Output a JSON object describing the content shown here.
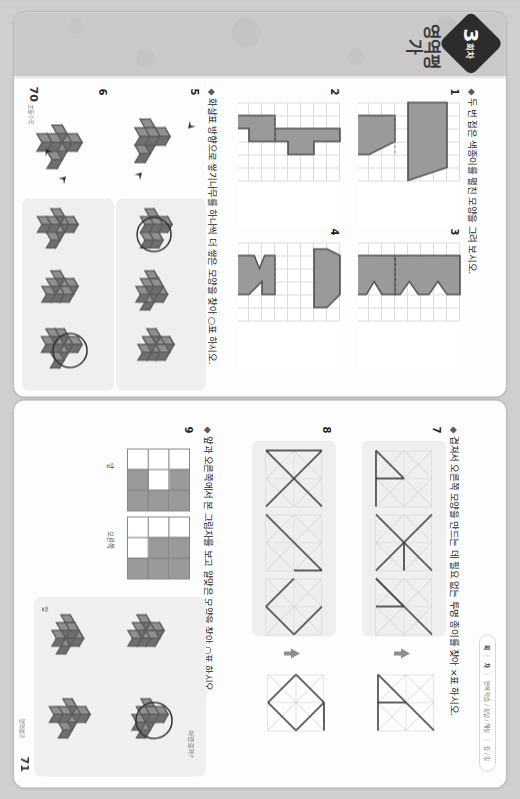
{
  "document": {
    "kind": "workbook-spread-scan",
    "rotation_note": "page is displayed rotated 90 degrees"
  },
  "left_page": {
    "badge": {
      "number": "3",
      "unit": "회차"
    },
    "section_title": "영역평가",
    "prompts": [
      {
        "bullet": "◆",
        "text": "두 번 접은 색종이를 펼친 모양을 그려 보시오."
      },
      {
        "bullet": "◆",
        "text": "화살표 방향으로 쌓기나무를 하나씩 더 쌓은 모양을 찾아 ○표 하시오."
      }
    ],
    "question_numbers": [
      "1",
      "2",
      "3",
      "4",
      "5",
      "6"
    ],
    "page_number": "70",
    "page_label": "초등수학"
  },
  "right_page": {
    "tab": {
      "items": [
        "회",
        "차",
        "반복 학습 / 정답 / 해설",
        "월 / 일"
      ],
      "active_index": 0
    },
    "prompts": [
      {
        "bullet": "◆",
        "text": "앞과 오른쪽에서 본 그림자를 보고 알맞은 모양을 찾아 ○표 하시오."
      },
      {
        "bullet": "◆",
        "text": "겹쳐서 오른쪽 모양을 만드는 데 필요 없는 투명 종이를 찾아 ×표 하시오."
      }
    ],
    "question_numbers": [
      "7",
      "8",
      "9"
    ],
    "shadow_labels": {
      "front": "앞",
      "right": "오른쪽"
    },
    "hint_label": "어떤걸까?",
    "page_number": "71",
    "page_label": "영역평가"
  },
  "colors": {
    "paper": "#fdfdfd",
    "rail": "#c9c9c9",
    "shape_fill": "#9a9a9a",
    "shape_stroke": "#4a4a4a",
    "grid_line": "#dcdcdc",
    "cube_top": "#b7b7b7",
    "cube_left": "#8f8f8f",
    "cube_right": "#6f6f6f",
    "shade_panel": "#efefef",
    "badge": "#2c2c2c"
  },
  "chart_data": {
    "type": "table",
    "grid_problems": [
      {
        "id": "1",
        "grid_cols": 6,
        "grid_rows": 8,
        "kind": "folded-then-unfolded",
        "folded_shape": "right-trapezoid",
        "unfolded_shape": "isosceles-trapezoid"
      },
      {
        "id": "2",
        "grid_cols": 6,
        "grid_rows": 8,
        "kind": "folded-then-unfolded",
        "folded_shape": "L-block",
        "unfolded_shape": "cross-block"
      },
      {
        "id": "3",
        "grid_cols": 6,
        "grid_rows": 8,
        "kind": "folded-then-unfolded",
        "folded_shape": "zigzag-step",
        "unfolded_shape": "double-zigzag"
      },
      {
        "id": "4",
        "grid_cols": 6,
        "grid_rows": 8,
        "kind": "folded-then-unfolded",
        "folded_shape": "notched-square",
        "unfolded_shape": "hex-with-triangle-notch"
      }
    ],
    "cube_problems": [
      {
        "id": "5",
        "given_arrows": 2,
        "options": 3,
        "answer_option": 1
      },
      {
        "id": "6",
        "given_arrows": 2,
        "options": 3,
        "answer_option": 3
      }
    ],
    "transparent_sheet_problems": [
      {
        "id": "7",
        "options": 3,
        "answer_option": 3
      },
      {
        "id": "8",
        "options": 3,
        "answer_option": 3
      }
    ],
    "shadow_problem": {
      "id": "9",
      "views": 2,
      "options": 4,
      "answer_option": 2
    }
  }
}
